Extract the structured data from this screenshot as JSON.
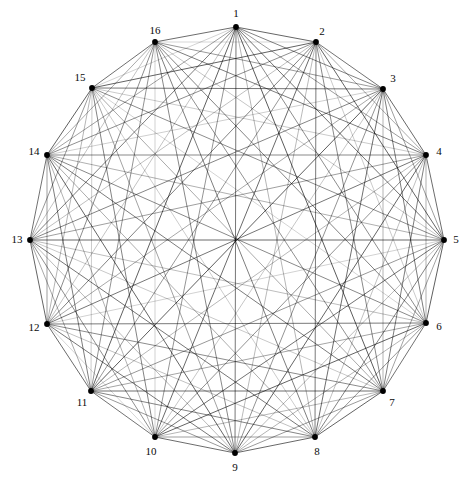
{
  "figure": {
    "type": "network-graph",
    "layout": "circular",
    "background_color": "#ffffff",
    "width": 466,
    "height": 481,
    "node_color": "#000000",
    "node_radius": 2.9,
    "edge_base_color": "#000000",
    "label_color": "#0a0a0a",
    "label_font_size": 11,
    "center_x": 236,
    "center_y": 240,
    "circle_radius": 207
  },
  "chart_data": {
    "type": "scatter",
    "title": "",
    "xlabel": "",
    "ylabel": "",
    "grid": false,
    "legend": "none",
    "node_count": 16,
    "edge_count": 115,
    "nodes": [
      {
        "id": 1,
        "label": "1",
        "x": 236,
        "y": 27,
        "label_x": 236,
        "label_y": 14,
        "angle_deg": 90
      },
      {
        "id": 2,
        "label": "2",
        "x": 316,
        "y": 42,
        "label_x": 322,
        "label_y": 32,
        "angle_deg": 67.5
      },
      {
        "id": 3,
        "label": "3",
        "x": 383,
        "y": 89,
        "label_x": 393,
        "label_y": 79,
        "angle_deg": 45
      },
      {
        "id": 4,
        "label": "4",
        "x": 426,
        "y": 155,
        "label_x": 439,
        "label_y": 152,
        "angle_deg": 22.5
      },
      {
        "id": 5,
        "label": "5",
        "x": 444,
        "y": 240,
        "label_x": 456,
        "label_y": 240,
        "angle_deg": 0
      },
      {
        "id": 6,
        "label": "6",
        "x": 426,
        "y": 323,
        "label_x": 439,
        "label_y": 327,
        "angle_deg": -22.5
      },
      {
        "id": 7,
        "label": "7",
        "x": 383,
        "y": 391,
        "label_x": 392,
        "label_y": 403,
        "angle_deg": -45
      },
      {
        "id": 8,
        "label": "8",
        "x": 315,
        "y": 437,
        "label_x": 317,
        "label_y": 452,
        "angle_deg": -67.5
      },
      {
        "id": 9,
        "label": "9",
        "x": 235,
        "y": 453,
        "label_x": 235,
        "label_y": 468,
        "angle_deg": -90
      },
      {
        "id": 10,
        "label": "10",
        "x": 155,
        "y": 437,
        "label_x": 151,
        "label_y": 452,
        "angle_deg": -112.5
      },
      {
        "id": 11,
        "label": "11",
        "x": 91,
        "y": 391,
        "label_x": 82,
        "label_y": 403,
        "angle_deg": -135
      },
      {
        "id": 12,
        "label": "12",
        "x": 47,
        "y": 324,
        "label_x": 34,
        "label_y": 328,
        "angle_deg": -157.5
      },
      {
        "id": 13,
        "label": "13",
        "x": 30,
        "y": 240,
        "label_x": 17,
        "label_y": 240,
        "angle_deg": 180
      },
      {
        "id": 14,
        "label": "14",
        "x": 47,
        "y": 155,
        "label_x": 34,
        "label_y": 152,
        "angle_deg": 157.5
      },
      {
        "id": 15,
        "label": "15",
        "x": 92,
        "y": 88,
        "label_x": 80,
        "label_y": 78,
        "angle_deg": 135
      },
      {
        "id": 16,
        "label": "16",
        "x": 155,
        "y": 42,
        "label_x": 155,
        "label_y": 31,
        "angle_deg": 112.5
      }
    ],
    "edges": [
      {
        "source": 1,
        "target": 2,
        "weight": 0.85
      },
      {
        "source": 1,
        "target": 3,
        "weight": 0.72
      },
      {
        "source": 1,
        "target": 4,
        "weight": 0.58
      },
      {
        "source": 1,
        "target": 5,
        "weight": 0.8
      },
      {
        "source": 1,
        "target": 6,
        "weight": 0.66
      },
      {
        "source": 1,
        "target": 7,
        "weight": 0.9
      },
      {
        "source": 1,
        "target": 8,
        "weight": 0.44
      },
      {
        "source": 1,
        "target": 9,
        "weight": 0.78
      },
      {
        "source": 1,
        "target": 10,
        "weight": 0.62
      },
      {
        "source": 1,
        "target": 11,
        "weight": 0.88
      },
      {
        "source": 1,
        "target": 12,
        "weight": 0.35
      },
      {
        "source": 1,
        "target": 13,
        "weight": 0.74
      },
      {
        "source": 1,
        "target": 14,
        "weight": 0.55
      },
      {
        "source": 1,
        "target": 15,
        "weight": 0.25
      },
      {
        "source": 1,
        "target": 16,
        "weight": 0.82
      },
      {
        "source": 2,
        "target": 3,
        "weight": 0.79
      },
      {
        "source": 2,
        "target": 4,
        "weight": 0.5
      },
      {
        "source": 2,
        "target": 5,
        "weight": 0.86
      },
      {
        "source": 2,
        "target": 6,
        "weight": 0.3
      },
      {
        "source": 2,
        "target": 7,
        "weight": 0.68
      },
      {
        "source": 2,
        "target": 8,
        "weight": 0.76
      },
      {
        "source": 2,
        "target": 9,
        "weight": 0.41
      },
      {
        "source": 2,
        "target": 10,
        "weight": 0.83
      },
      {
        "source": 2,
        "target": 11,
        "weight": 0.6
      },
      {
        "source": 2,
        "target": 12,
        "weight": 0.72
      },
      {
        "source": 2,
        "target": 13,
        "weight": 0.38
      },
      {
        "source": 2,
        "target": 14,
        "weight": 0.65
      },
      {
        "source": 2,
        "target": 15,
        "weight": 0.87
      },
      {
        "source": 2,
        "target": 16,
        "weight": 0.22
      },
      {
        "source": 3,
        "target": 4,
        "weight": 0.84
      },
      {
        "source": 3,
        "target": 5,
        "weight": 0.57
      },
      {
        "source": 3,
        "target": 6,
        "weight": 0.75
      },
      {
        "source": 3,
        "target": 7,
        "weight": 0.46
      },
      {
        "source": 3,
        "target": 8,
        "weight": 0.81
      },
      {
        "source": 3,
        "target": 9,
        "weight": 0.63
      },
      {
        "source": 3,
        "target": 10,
        "weight": 0.33
      },
      {
        "source": 3,
        "target": 11,
        "weight": 0.89
      },
      {
        "source": 3,
        "target": 12,
        "weight": 0.52
      },
      {
        "source": 3,
        "target": 13,
        "weight": 0.7
      },
      {
        "source": 3,
        "target": 14,
        "weight": 0.28
      },
      {
        "source": 3,
        "target": 15,
        "weight": 0.77
      },
      {
        "source": 3,
        "target": 16,
        "weight": 0.59
      },
      {
        "source": 4,
        "target": 5,
        "weight": 0.82
      },
      {
        "source": 4,
        "target": 6,
        "weight": 0.48
      },
      {
        "source": 4,
        "target": 7,
        "weight": 0.73
      },
      {
        "source": 4,
        "target": 8,
        "weight": 0.36
      },
      {
        "source": 4,
        "target": 9,
        "weight": 0.85
      },
      {
        "source": 4,
        "target": 10,
        "weight": 0.64
      },
      {
        "source": 4,
        "target": 11,
        "weight": 0.42
      },
      {
        "source": 4,
        "target": 12,
        "weight": 0.78
      },
      {
        "source": 4,
        "target": 13,
        "weight": 0.56
      },
      {
        "source": 4,
        "target": 14,
        "weight": 0.69
      },
      {
        "source": 4,
        "target": 15,
        "weight": 0.31
      },
      {
        "source": 4,
        "target": 16,
        "weight": 0.74
      },
      {
        "source": 5,
        "target": 6,
        "weight": 0.88
      },
      {
        "source": 5,
        "target": 7,
        "weight": 0.54
      },
      {
        "source": 5,
        "target": 8,
        "weight": 0.71
      },
      {
        "source": 5,
        "target": 9,
        "weight": 0.4
      },
      {
        "source": 5,
        "target": 10,
        "weight": 0.79
      },
      {
        "source": 5,
        "target": 11,
        "weight": 0.61
      },
      {
        "source": 5,
        "target": 12,
        "weight": 0.26
      },
      {
        "source": 5,
        "target": 13,
        "weight": 0.83
      },
      {
        "source": 5,
        "target": 14,
        "weight": 0.47
      },
      {
        "source": 5,
        "target": 15,
        "weight": 0.66
      },
      {
        "source": 5,
        "target": 16,
        "weight": 0.34
      },
      {
        "source": 6,
        "target": 7,
        "weight": 0.8
      },
      {
        "source": 6,
        "target": 8,
        "weight": 0.62
      },
      {
        "source": 6,
        "target": 9,
        "weight": 0.45
      },
      {
        "source": 6,
        "target": 10,
        "weight": 0.86
      },
      {
        "source": 6,
        "target": 11,
        "weight": 0.53
      },
      {
        "source": 6,
        "target": 12,
        "weight": 0.76
      },
      {
        "source": 6,
        "target": 13,
        "weight": 0.39
      },
      {
        "source": 6,
        "target": 14,
        "weight": 0.68
      },
      {
        "source": 6,
        "target": 15,
        "weight": 0.24
      },
      {
        "source": 6,
        "target": 16,
        "weight": 0.72
      },
      {
        "source": 7,
        "target": 8,
        "weight": 0.87
      },
      {
        "source": 7,
        "target": 9,
        "weight": 0.59
      },
      {
        "source": 7,
        "target": 10,
        "weight": 0.43
      },
      {
        "source": 7,
        "target": 11,
        "weight": 0.81
      },
      {
        "source": 7,
        "target": 12,
        "weight": 0.67
      },
      {
        "source": 7,
        "target": 13,
        "weight": 0.32
      },
      {
        "source": 7,
        "target": 14,
        "weight": 0.75
      },
      {
        "source": 7,
        "target": 15,
        "weight": 0.51
      },
      {
        "source": 7,
        "target": 16,
        "weight": 0.64
      },
      {
        "source": 8,
        "target": 9,
        "weight": 0.84
      },
      {
        "source": 8,
        "target": 10,
        "weight": 0.57
      },
      {
        "source": 8,
        "target": 11,
        "weight": 0.7
      },
      {
        "source": 8,
        "target": 12,
        "weight": 0.37
      },
      {
        "source": 8,
        "target": 13,
        "weight": 0.78
      },
      {
        "source": 8,
        "target": 14,
        "weight": 0.49
      },
      {
        "source": 8,
        "target": 15,
        "weight": 0.29
      },
      {
        "source": 8,
        "target": 16,
        "weight": 0.73
      },
      {
        "source": 9,
        "target": 10,
        "weight": 0.82
      },
      {
        "source": 9,
        "target": 11,
        "weight": 0.6
      },
      {
        "source": 9,
        "target": 12,
        "weight": 0.77
      },
      {
        "source": 9,
        "target": 13,
        "weight": 0.41
      },
      {
        "source": 9,
        "target": 14,
        "weight": 0.85
      },
      {
        "source": 9,
        "target": 15,
        "weight": 0.55
      },
      {
        "source": 9,
        "target": 16,
        "weight": 0.69
      },
      {
        "source": 10,
        "target": 11,
        "weight": 0.79
      },
      {
        "source": 10,
        "target": 12,
        "weight": 0.23
      },
      {
        "source": 10,
        "target": 13,
        "weight": 0.65
      },
      {
        "source": 10,
        "target": 14,
        "weight": 0.46
      },
      {
        "source": 10,
        "target": 15,
        "weight": 0.71
      },
      {
        "source": 10,
        "target": 16,
        "weight": 0.27
      },
      {
        "source": 11,
        "target": 12,
        "weight": 0.83
      },
      {
        "source": 11,
        "target": 13,
        "weight": 0.52
      },
      {
        "source": 11,
        "target": 14,
        "weight": 0.74
      },
      {
        "source": 11,
        "target": 15,
        "weight": 0.3
      },
      {
        "source": 11,
        "target": 16,
        "weight": 0.63
      },
      {
        "source": 12,
        "target": 13,
        "weight": 0.86
      },
      {
        "source": 12,
        "target": 14,
        "weight": 0.58
      },
      {
        "source": 12,
        "target": 15,
        "weight": 0.44
      },
      {
        "source": 12,
        "target": 16,
        "weight": 0.67
      },
      {
        "source": 13,
        "target": 14,
        "weight": 0.8
      },
      {
        "source": 13,
        "target": 15,
        "weight": 0.61
      },
      {
        "source": 13,
        "target": 16,
        "weight": 0.35
      },
      {
        "source": 14,
        "target": 15,
        "weight": 0.88
      },
      {
        "source": 14,
        "target": 16,
        "weight": 0.5
      },
      {
        "source": 15,
        "target": 16,
        "weight": 0.81
      }
    ]
  }
}
